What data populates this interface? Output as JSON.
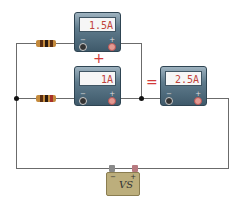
{
  "diagram": {
    "meters": [
      {
        "id": "top",
        "reading": "1.5A",
        "neg": "−",
        "pos": "+"
      },
      {
        "id": "middle",
        "reading": "1A",
        "neg": "−",
        "pos": "+"
      },
      {
        "id": "total",
        "reading": "2.5A",
        "neg": "−",
        "pos": "+"
      }
    ],
    "operators": {
      "plus": "+",
      "equals": "="
    },
    "battery": {
      "label": "VS",
      "neg": "−",
      "pos": "+"
    },
    "colors": {
      "reading": "#c0443c",
      "operator": "#d23a3a",
      "wire": "#6b6b6b"
    }
  }
}
